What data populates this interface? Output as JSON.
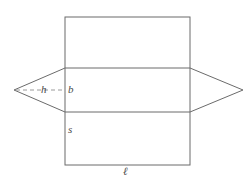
{
  "figure": {
    "background_color": "#ffffff",
    "stroke_color": "#6b6b6b",
    "dashed_stroke_color": "#9a9a9a",
    "label_color": "#4a4a4a",
    "labels": {
      "h": "h",
      "b": "b",
      "s": "s",
      "ell": "ℓ"
    },
    "geometry": {
      "rectangle": {
        "left": 65,
        "top": 17,
        "right": 190,
        "bottom": 165
      },
      "band": {
        "top_line_y": 68,
        "bottom_line_y": 112
      },
      "left_vertex": {
        "x": 14,
        "y": 90
      },
      "right_vertex": {
        "x": 243,
        "y": 90
      },
      "dashed_segment": {
        "x1": 16,
        "y1": 90,
        "x2": 65,
        "y2": 90
      }
    }
  }
}
